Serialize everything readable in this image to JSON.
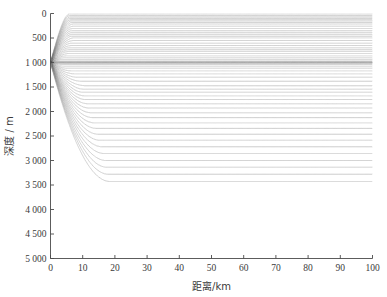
{
  "chart_data": {
    "type": "line",
    "title": "",
    "subtitle": "",
    "xlabel": "距离/km",
    "ylabel": "深度 / m",
    "xlim": [
      0,
      100
    ],
    "ylim": [
      0,
      5000
    ],
    "y_axis_inverted": true,
    "grid": false,
    "legend": null,
    "xticks": [
      0,
      10,
      20,
      30,
      40,
      50,
      60,
      70,
      80,
      90,
      100
    ],
    "xticklabels": [
      "0",
      "10",
      "20",
      "30",
      "40",
      "50",
      "60",
      "70",
      "80",
      "90",
      "100"
    ],
    "yticks": [
      0,
      500,
      1000,
      1500,
      2000,
      2500,
      3000,
      3500,
      4000,
      4500,
      5000
    ],
    "yticklabels": [
      "0",
      "500",
      "1 000",
      "1 500",
      "2 000",
      "2 500",
      "3 000",
      "3 500",
      "4 000",
      "4 500",
      "5 000"
    ],
    "line_color": "#8a8a8a",
    "line_width": 0.45,
    "background": "#ffffff",
    "axis_color": "#4a4a4a",
    "source": {
      "range_km": 0,
      "depth_m": 1000
    },
    "channel_axis_depth_m": 1000,
    "seafloor_depth_m": 5000,
    "launch_angle_deg_min": -14,
    "launch_angle_deg_max": 14,
    "ray_count": 57,
    "convergence_zones_km": [
      48,
      95
    ],
    "ssp_profile": {
      "depth_m": [
        0,
        200,
        500,
        800,
        1000,
        1500,
        2000,
        3000,
        4000,
        5000
      ],
      "speed_mps": [
        1530,
        1510,
        1495,
        1487,
        1484,
        1490,
        1500,
        1520,
        1542,
        1565
      ]
    },
    "series": [
      {
        "name": "ray-bundle",
        "values": []
      }
    ]
  }
}
